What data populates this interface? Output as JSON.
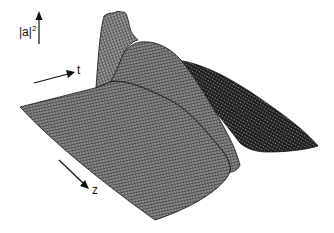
{
  "figure": {
    "type": "3d-wireframe-surface",
    "axes": {
      "vertical_label": "|a|",
      "vertical_superscript": "2",
      "t_label": "t",
      "z_label": "z"
    },
    "colors": {
      "background": "#ffffff",
      "mesh": "#111111",
      "surface_fill": "#6a6a6a",
      "dark_ridge": "#1c1c1c"
    }
  }
}
